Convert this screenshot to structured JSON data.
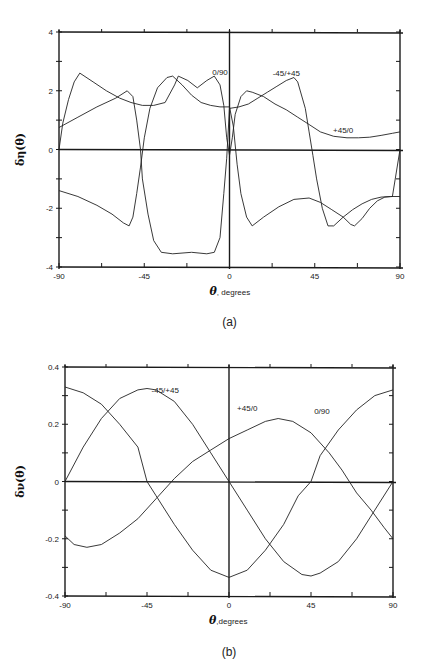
{
  "chart_data": [
    {
      "id": "a",
      "type": "line",
      "caption": "(a)",
      "title": "",
      "xlabel_symbol": "θ",
      "xlabel_text": ", degrees",
      "ylabel": "δη(θ)",
      "xlim": [
        -90,
        90
      ],
      "ylim": [
        -4,
        4
      ],
      "xticks": [
        -90,
        -45,
        0,
        45,
        90
      ],
      "xtick_labels": [
        "-90",
        "-45",
        "0",
        "45",
        "90"
      ],
      "yticks": [
        -4,
        -2,
        0,
        2,
        4
      ],
      "ytick_labels": [
        "-4",
        "-2",
        "0",
        "2",
        "4"
      ],
      "minor_xtick_step": 22.5,
      "minor_ytick_step": 1,
      "grid": false,
      "zero_lines": true,
      "series": [
        {
          "name": "0/90",
          "label_pos": [
            -5,
            2.55
          ],
          "points": [
            [
              -90,
              0
            ],
            [
              -88,
              0.9
            ],
            [
              -85,
              1.7
            ],
            [
              -82,
              2.3
            ],
            [
              -79,
              2.6
            ],
            [
              -72,
              2.3
            ],
            [
              -65,
              2.0
            ],
            [
              -58,
              1.75
            ],
            [
              -52,
              1.6
            ],
            [
              -46,
              1.5
            ],
            [
              -40,
              1.5
            ],
            [
              -34,
              1.6
            ],
            [
              -29,
              2.2
            ],
            [
              -27,
              2.5
            ],
            [
              -22,
              2.35
            ],
            [
              -17,
              2.1
            ],
            [
              -12,
              2.35
            ],
            [
              -8,
              2.5
            ],
            [
              -5,
              2.2
            ],
            [
              -3,
              1.5
            ],
            [
              -1.5,
              0.4
            ],
            [
              0,
              -0.2
            ],
            [
              1.5,
              0.4
            ],
            [
              3,
              1.2
            ],
            [
              6,
              1.8
            ],
            [
              9,
              2.0
            ],
            [
              12,
              1.95
            ],
            [
              18,
              1.8
            ],
            [
              24,
              1.55
            ],
            [
              30,
              1.35
            ],
            [
              36,
              1.1
            ],
            [
              42,
              0.85
            ],
            [
              48,
              0.6
            ],
            [
              55,
              0.45
            ],
            [
              62,
              0.4
            ],
            [
              68,
              0.4
            ],
            [
              74,
              0.42
            ],
            [
              80,
              0.48
            ],
            [
              86,
              0.55
            ],
            [
              90,
              0.6
            ]
          ]
        },
        {
          "name": "-45/+45",
          "label_pos": [
            30,
            2.5
          ],
          "points": [
            [
              -90,
              0.75
            ],
            [
              -80,
              1.1
            ],
            [
              -70,
              1.45
            ],
            [
              -60,
              1.75
            ],
            [
              -54,
              2.0
            ],
            [
              -51,
              1.8
            ],
            [
              -49,
              1.0
            ],
            [
              -47,
              0.0
            ],
            [
              -46,
              -1.0
            ],
            [
              -43,
              -2.2
            ],
            [
              -40,
              -3.1
            ],
            [
              -36,
              -3.5
            ],
            [
              -30,
              -3.55
            ],
            [
              -20,
              -3.5
            ],
            [
              -12,
              -3.55
            ],
            [
              -8,
              -3.5
            ],
            [
              -5,
              -3.0
            ],
            [
              -3,
              -1.5
            ],
            [
              -1.5,
              -0.3
            ],
            [
              0,
              1.4
            ],
            [
              5,
              1.45
            ],
            [
              10,
              1.55
            ],
            [
              15,
              1.75
            ],
            [
              20,
              1.95
            ],
            [
              25,
              2.15
            ],
            [
              30,
              2.35
            ],
            [
              34,
              2.45
            ],
            [
              36,
              2.3
            ],
            [
              40,
              1.4
            ],
            [
              42,
              0.6
            ],
            [
              44,
              -0.2
            ],
            [
              46,
              -1.0
            ],
            [
              49,
              -2.0
            ],
            [
              52,
              -2.6
            ],
            [
              55,
              -2.6
            ],
            [
              60,
              -2.3
            ],
            [
              65,
              -2.05
            ],
            [
              70,
              -1.85
            ],
            [
              75,
              -1.7
            ],
            [
              80,
              -1.62
            ],
            [
              85,
              -1.6
            ],
            [
              90,
              -1.6
            ]
          ]
        },
        {
          "name": "+45/0",
          "label_pos": [
            60,
            0.55
          ],
          "points": [
            [
              -90,
              -1.4
            ],
            [
              -80,
              -1.6
            ],
            [
              -70,
              -1.9
            ],
            [
              -62,
              -2.2
            ],
            [
              -56,
              -2.5
            ],
            [
              -53,
              -2.6
            ],
            [
              -51,
              -2.3
            ],
            [
              -49,
              -1.5
            ],
            [
              -47,
              -0.6
            ],
            [
              -45,
              0.4
            ],
            [
              -42,
              1.4
            ],
            [
              -38,
              2.1
            ],
            [
              -33,
              2.45
            ],
            [
              -30,
              2.5
            ],
            [
              -25,
              2.2
            ],
            [
              -20,
              1.85
            ],
            [
              -15,
              1.6
            ],
            [
              -10,
              1.5
            ],
            [
              -5,
              1.45
            ],
            [
              0,
              1.45
            ],
            [
              2,
              0.8
            ],
            [
              4,
              -0.5
            ],
            [
              6,
              -1.5
            ],
            [
              9,
              -2.3
            ],
            [
              12,
              -2.6
            ],
            [
              18,
              -2.3
            ],
            [
              26,
              -1.95
            ],
            [
              34,
              -1.7
            ],
            [
              42,
              -1.65
            ],
            [
              48,
              -1.8
            ],
            [
              54,
              -2.05
            ],
            [
              60,
              -2.3
            ],
            [
              64,
              -2.55
            ],
            [
              66,
              -2.6
            ],
            [
              70,
              -2.35
            ],
            [
              74,
              -2.0
            ],
            [
              78,
              -1.75
            ],
            [
              82,
              -1.62
            ],
            [
              86,
              -1.6
            ],
            [
              88,
              -0.8
            ],
            [
              90,
              0
            ]
          ]
        }
      ]
    },
    {
      "id": "b",
      "type": "line",
      "caption": "(b)",
      "title": "",
      "xlabel_symbol": "θ",
      "xlabel_text": ",degrees",
      "ylabel": "δν(θ)",
      "xlim": [
        -90,
        90
      ],
      "ylim": [
        -0.4,
        0.4
      ],
      "xticks": [
        -90,
        -45,
        0,
        45,
        90
      ],
      "xtick_labels": [
        "-90",
        "-45",
        "0",
        "45",
        "90"
      ],
      "yticks": [
        -0.4,
        -0.2,
        0,
        0.2,
        0.4
      ],
      "ytick_labels": [
        "-0.4",
        "-0.2",
        "0",
        "0.2",
        "0.4"
      ],
      "minor_xtick_step": 22.5,
      "minor_ytick_step": 0.1,
      "grid": false,
      "zero_lines": true,
      "series": [
        {
          "name": "-45/+45",
          "label_pos": [
            -35,
            0.31
          ],
          "points": [
            [
              -90,
              0.0
            ],
            [
              -80,
              0.12
            ],
            [
              -70,
              0.22
            ],
            [
              -60,
              0.29
            ],
            [
              -50,
              0.32
            ],
            [
              -45,
              0.325
            ],
            [
              -40,
              0.32
            ],
            [
              -30,
              0.28
            ],
            [
              -20,
              0.2
            ],
            [
              -10,
              0.1
            ],
            [
              0,
              0.0
            ],
            [
              10,
              -0.1
            ],
            [
              20,
              -0.2
            ],
            [
              30,
              -0.28
            ],
            [
              40,
              -0.325
            ],
            [
              45,
              -0.33
            ],
            [
              50,
              -0.32
            ],
            [
              60,
              -0.28
            ],
            [
              70,
              -0.2
            ],
            [
              80,
              -0.1
            ],
            [
              90,
              0.0
            ]
          ]
        },
        {
          "name": "+45/0",
          "label_pos": [
            10,
            0.245
          ],
          "points": [
            [
              -90,
              -0.19
            ],
            [
              -85,
              -0.22
            ],
            [
              -78,
              -0.23
            ],
            [
              -70,
              -0.22
            ],
            [
              -60,
              -0.18
            ],
            [
              -50,
              -0.13
            ],
            [
              -40,
              -0.06
            ],
            [
              -30,
              0.01
            ],
            [
              -20,
              0.07
            ],
            [
              -10,
              0.11
            ],
            [
              0,
              0.15
            ],
            [
              10,
              0.18
            ],
            [
              20,
              0.21
            ],
            [
              27,
              0.22
            ],
            [
              35,
              0.21
            ],
            [
              45,
              0.17
            ],
            [
              55,
              0.1
            ],
            [
              62,
              0.04
            ],
            [
              70,
              -0.04
            ],
            [
              78,
              -0.1
            ],
            [
              85,
              -0.16
            ],
            [
              90,
              -0.2
            ]
          ]
        },
        {
          "name": "0/90",
          "label_pos": [
            51,
            0.235
          ],
          "points": [
            [
              -90,
              0.33
            ],
            [
              -80,
              0.31
            ],
            [
              -70,
              0.27
            ],
            [
              -60,
              0.2
            ],
            [
              -50,
              0.12
            ],
            [
              -45,
              0.0
            ],
            [
              -40,
              -0.05
            ],
            [
              -30,
              -0.15
            ],
            [
              -20,
              -0.24
            ],
            [
              -10,
              -0.31
            ],
            [
              0,
              -0.335
            ],
            [
              10,
              -0.31
            ],
            [
              20,
              -0.24
            ],
            [
              30,
              -0.15
            ],
            [
              38,
              -0.05
            ],
            [
              45,
              0.0
            ],
            [
              50,
              0.09
            ],
            [
              60,
              0.18
            ],
            [
              70,
              0.25
            ],
            [
              80,
              0.3
            ],
            [
              90,
              0.32
            ]
          ]
        }
      ]
    }
  ],
  "layout": {
    "panels": [
      {
        "x0": 59,
        "x1": 400,
        "y_top": 32,
        "y_bottom": 267,
        "caption_y": 326
      },
      {
        "x0": 65,
        "x1": 393,
        "y_top": 367,
        "y_bottom": 596,
        "caption_y": 656
      }
    ]
  }
}
